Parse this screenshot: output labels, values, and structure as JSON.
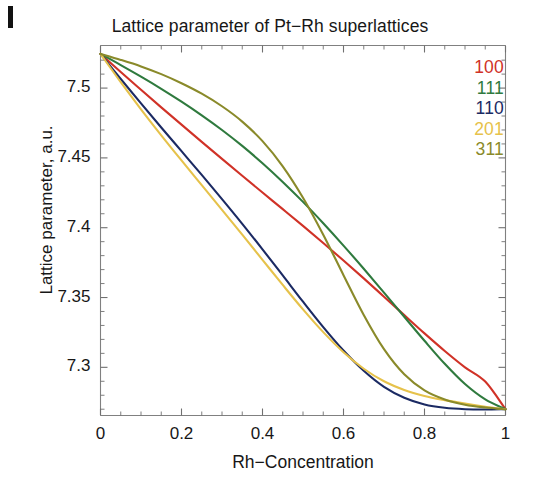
{
  "chart_data": {
    "type": "line",
    "title": "Lattice parameter of Pt−Rh superlattices",
    "xlabel": "Rh−Concentration",
    "ylabel": "Lattice parameter, a.u.",
    "xlim": [
      0,
      1
    ],
    "ylim": [
      7.2655,
      7.5305
    ],
    "grid": false,
    "legend_position": "top-right",
    "xticks": [
      "0",
      "0.2",
      "0.4",
      "0.6",
      "0.8",
      "1"
    ],
    "xtick_values": [
      0,
      0.2,
      0.4,
      0.6,
      0.8,
      1
    ],
    "yticks": [
      "7.5",
      "7.45",
      "7.4",
      "7.35",
      "7.3"
    ],
    "ytick_values": [
      7.5,
      7.45,
      7.4,
      7.35,
      7.3
    ],
    "x": [
      0,
      0.05,
      0.1,
      0.15,
      0.2,
      0.25,
      0.3,
      0.35,
      0.4,
      0.45,
      0.5,
      0.55,
      0.6,
      0.65,
      0.7,
      0.75,
      0.8,
      0.85,
      0.9,
      0.95,
      1
    ],
    "series": [
      {
        "name": "100",
        "color": "#d03227",
        "values": [
          7.5245,
          7.5115,
          7.4988,
          7.4862,
          7.4738,
          7.4615,
          7.4493,
          7.4372,
          7.4252,
          7.4133,
          7.4013,
          7.389,
          7.3765,
          7.3637,
          7.3506,
          7.3374,
          7.3243,
          7.3117,
          7.3,
          7.2898,
          7.27
        ]
      },
      {
        "name": "111",
        "color": "#2f7a3e",
        "values": [
          7.5245,
          7.5165,
          7.5082,
          7.4995,
          7.4903,
          7.4805,
          7.47,
          7.4586,
          7.4462,
          7.4328,
          7.4185,
          7.4032,
          7.3872,
          7.3706,
          7.3535,
          7.3362,
          7.319,
          7.3025,
          7.288,
          7.277,
          7.27
        ]
      },
      {
        "name": "110",
        "color": "#1b2a63",
        "values": [
          7.5245,
          7.5065,
          7.489,
          7.4718,
          7.4548,
          7.4378,
          7.4205,
          7.4028,
          7.3845,
          7.3658,
          7.347,
          7.3288,
          7.312,
          7.2975,
          7.286,
          7.2782,
          7.2734,
          7.271,
          7.27,
          7.2698,
          7.27
        ]
      },
      {
        "name": "201",
        "color": "#e6c24b",
        "values": [
          7.5245,
          7.5042,
          7.4848,
          7.4662,
          7.4482,
          7.4305,
          7.4128,
          7.395,
          7.377,
          7.359,
          7.3415,
          7.3252,
          7.3108,
          7.299,
          7.29,
          7.2838,
          7.2795,
          7.2765,
          7.274,
          7.2718,
          7.27
        ]
      },
      {
        "name": "311",
        "color": "#8a8a2a",
        "values": [
          7.5245,
          7.5202,
          7.5155,
          7.51,
          7.5035,
          7.496,
          7.487,
          7.476,
          7.462,
          7.444,
          7.4215,
          7.395,
          7.366,
          7.3375,
          7.313,
          7.295,
          7.2835,
          7.277,
          7.2732,
          7.2712,
          7.27
        ]
      }
    ]
  },
  "legend": {
    "entries": [
      {
        "label": "100",
        "color": "#d03227"
      },
      {
        "label": "111",
        "color": "#2f7a3e"
      },
      {
        "label": "110",
        "color": "#1b2a63"
      },
      {
        "label": "201",
        "color": "#e6c24b"
      },
      {
        "label": "311",
        "color": "#8a8a2a"
      }
    ]
  },
  "axes": {
    "frame_color": "#808080",
    "tick_color": "#707070"
  }
}
